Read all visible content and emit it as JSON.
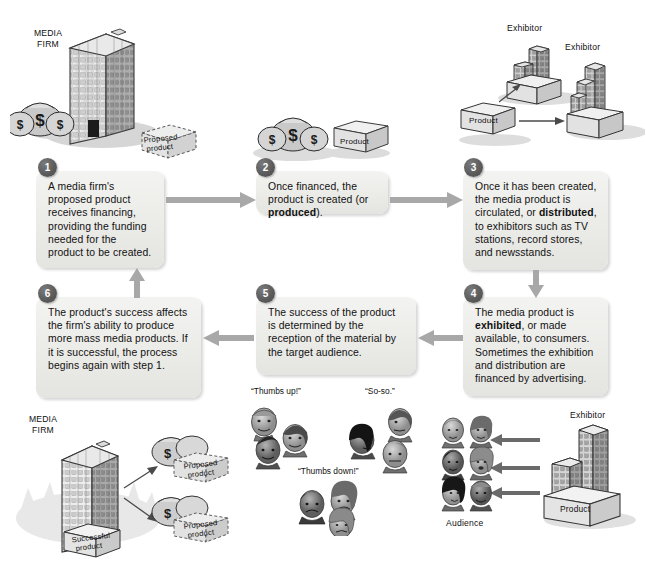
{
  "diagram": {
    "background_color": "#ffffff",
    "box_fill": "#ececea",
    "badge_color": "#5c5c5c",
    "arrow_color": "#a8a8a8"
  },
  "steps": [
    {
      "number": "1",
      "text_html": "A media firm's proposed product receives financing, providing the funding needed for the product to be created.",
      "plain": "A media firm's proposed product receives financing, providing the funding needed for the product to be created."
    },
    {
      "number": "2",
      "text_html": "Once financed, the product is created (or <b>produced</b>).",
      "plain": "Once financed, the product is created (or produced)."
    },
    {
      "number": "3",
      "text_html": "Once it has been created, the media product is circulated, or <b>distributed</b>, to exhibitors such as TV stations, record stores, and newsstands.",
      "plain": "Once it has been created, the media product is circulated, or distributed, to exhibitors such as TV stations, record stores, and newsstands."
    },
    {
      "number": "4",
      "text_html": "The media product is <b>exhibited</b>, or made available, to consumers. Sometimes the exhibition and distribution are financed by advertising.",
      "plain": "The media product is exhibited, or made available, to consumers. Sometimes the exhibition and distribution are financed by advertising."
    },
    {
      "number": "5",
      "text_html": "The success of the product is determined by the reception of the material by the target audience.",
      "plain": "The success of the product is determined by the reception of the material by the target audience."
    },
    {
      "number": "6",
      "text_html": "The product's success affects the firm's ability to produce more mass media products. If it is successful, the process begins again with step 1.",
      "plain": "The product's success affects the firm's ability to produce more mass media products. If it is successful, the process begins again with step 1."
    }
  ],
  "labels": {
    "media_firm_top": "MEDIA\nFIRM",
    "media_firm_top_line1": "MEDIA",
    "media_firm_top_line2": "FIRM",
    "media_firm_bottom_line1": "MEDIA",
    "media_firm_bottom_line2": "FIRM",
    "proposed_product_top_line1": "Proposed",
    "proposed_product_top_line2": "product",
    "product_step2": "Product",
    "product_step3": "Product",
    "product_bottom_right": "Product",
    "exhibitor_top_left": "Exhibitor",
    "exhibitor_top_right": "Exhibitor",
    "exhibitor_bottom_right": "Exhibitor",
    "audience": "Audience",
    "successful_product_line1": "Successful",
    "successful_product_line2": "product",
    "proposed_product_b1_line1": "Proposed",
    "proposed_product_b1_line2": "product",
    "proposed_product_b2_line1": "Proposed",
    "proposed_product_b2_line2": "product",
    "thumbs_up": "“Thumbs up!”",
    "so_so": "“So-so.”",
    "thumbs_down": "“Thumbs down!”"
  }
}
